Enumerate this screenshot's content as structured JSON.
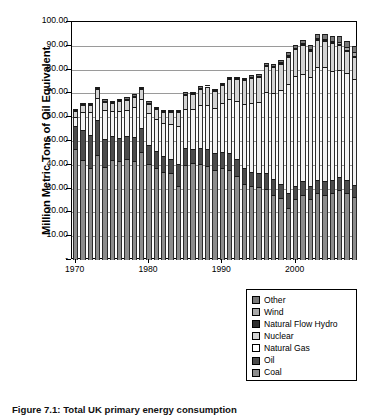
{
  "chart_data": {
    "type": "bar",
    "stacked": true,
    "title": "",
    "xlabel": "",
    "ylabel": "Million Metric Tons of Oil Equivalent",
    "ylim": [
      0,
      100
    ],
    "ytick_labels": [
      "100.00",
      "90.00",
      "80.00",
      "70.00",
      "60.00",
      "50.00",
      "40.00",
      "30.00",
      "20.00",
      "10.00",
      "-"
    ],
    "ytick_values": [
      100,
      90,
      80,
      70,
      60,
      50,
      40,
      30,
      20,
      10,
      0
    ],
    "xtick_labels": [
      "1970",
      "1980",
      "1990",
      "2000"
    ],
    "xtick_values": [
      1970,
      1980,
      1990,
      2000
    ],
    "grid": true,
    "legend_position": "below-right",
    "categories": [
      1970,
      1971,
      1972,
      1973,
      1974,
      1975,
      1976,
      1977,
      1978,
      1979,
      1980,
      1981,
      1982,
      1983,
      1984,
      1985,
      1986,
      1987,
      1988,
      1989,
      1990,
      1991,
      1992,
      1993,
      1994,
      1995,
      1996,
      1997,
      1998,
      1999,
      2000,
      2001,
      2002,
      2003,
      2004,
      2005,
      2006,
      2007,
      2008
    ],
    "series": [
      {
        "name": "Coal",
        "color": "#8c8c8c",
        "values": [
          46.5,
          42.0,
          38.6,
          44.2,
          39.0,
          42.0,
          41.8,
          42.4,
          41.6,
          45.3,
          40.2,
          38.8,
          37.0,
          36.5,
          31.0,
          40.0,
          40.8,
          40.5,
          39.5,
          38.0,
          38.5,
          38.0,
          35.5,
          32.0,
          31.0,
          30.5,
          30.0,
          27.5,
          26.0,
          22.0,
          25.5,
          27.5,
          25.5,
          28.0,
          27.5,
          28.0,
          29.5,
          28.0,
          26.5
        ],
        "unit": "Million Metric Tons of Oil Equivalent"
      },
      {
        "name": "Oil",
        "color": "#4c4c4c",
        "values": [
          10.0,
          12.5,
          14.0,
          14.5,
          12.0,
          10.0,
          9.5,
          9.5,
          10.0,
          10.0,
          8.0,
          7.0,
          6.5,
          6.0,
          9.5,
          7.0,
          6.0,
          6.5,
          7.0,
          7.0,
          7.0,
          7.0,
          7.0,
          6.5,
          6.0,
          6.0,
          6.5,
          6.5,
          6.0,
          6.0,
          5.5,
          5.5,
          5.5,
          5.5,
          5.5,
          5.5,
          5.5,
          5.5,
          5.0
        ],
        "unit": "Million Metric Tons of Oil Equivalent"
      },
      {
        "name": "Natural Gas",
        "color": "#f2f2f2",
        "values": [
          3.5,
          7.5,
          9.5,
          9.5,
          12.0,
          10.5,
          11.5,
          11.0,
          12.5,
          12.5,
          13.5,
          13.5,
          14.0,
          14.5,
          16.0,
          16.5,
          16.5,
          18.0,
          18.5,
          19.0,
          20.5,
          22.5,
          24.5,
          27.0,
          29.0,
          30.0,
          34.0,
          36.0,
          39.5,
          46.0,
          46.5,
          45.0,
          46.0,
          47.5,
          48.0,
          46.0,
          45.0,
          45.0,
          44.5
        ],
        "unit": "Million Metric Tons of Oil Equivalent"
      },
      {
        "name": "Nuclear",
        "color": "#d4d4d4",
        "values": [
          2.5,
          3.0,
          3.0,
          3.5,
          3.5,
          3.5,
          4.0,
          4.5,
          4.5,
          4.0,
          4.0,
          4.0,
          4.5,
          5.0,
          5.5,
          6.0,
          6.5,
          7.0,
          7.5,
          7.0,
          7.5,
          8.5,
          9.0,
          10.0,
          10.5,
          10.5,
          11.0,
          11.0,
          11.0,
          11.5,
          11.0,
          12.5,
          11.0,
          11.5,
          11.0,
          11.5,
          10.5,
          9.5,
          9.5
        ],
        "unit": "Million Metric Tons of Oil Equivalent"
      },
      {
        "name": "Natural Flow Hydro",
        "color": "#2e2e2e",
        "values": [
          0.4,
          0.4,
          0.4,
          0.4,
          0.4,
          0.4,
          0.4,
          0.4,
          0.4,
          0.4,
          0.4,
          0.4,
          0.4,
          0.4,
          0.4,
          0.4,
          0.4,
          0.4,
          0.4,
          0.4,
          0.4,
          0.4,
          0.4,
          0.4,
          0.4,
          0.4,
          0.4,
          0.4,
          0.4,
          0.4,
          0.4,
          0.4,
          0.4,
          0.4,
          0.4,
          0.4,
          0.4,
          0.4,
          0.4
        ],
        "unit": "Million Metric Tons of Oil Equivalent"
      },
      {
        "name": "Wind",
        "color": "#a8a8a8",
        "values": [
          0.0,
          0.0,
          0.0,
          0.0,
          0.0,
          0.0,
          0.0,
          0.0,
          0.0,
          0.0,
          0.0,
          0.0,
          0.0,
          0.0,
          0.0,
          0.0,
          0.0,
          0.0,
          0.0,
          0.0,
          0.0,
          0.0,
          0.0,
          0.0,
          0.1,
          0.1,
          0.1,
          0.1,
          0.1,
          0.2,
          0.2,
          0.2,
          0.3,
          0.3,
          0.4,
          0.6,
          0.8,
          1.0,
          1.3
        ],
        "unit": "Million Metric Tons of Oil Equivalent"
      },
      {
        "name": "Other",
        "color": "#7a7a7a",
        "values": [
          0.6,
          0.6,
          0.6,
          0.6,
          0.6,
          0.6,
          0.6,
          0.6,
          0.6,
          0.6,
          0.6,
          0.6,
          0.6,
          0.6,
          0.6,
          0.6,
          0.6,
          0.6,
          0.6,
          0.6,
          0.6,
          0.6,
          0.7,
          0.7,
          0.8,
          0.8,
          0.9,
          0.9,
          1.0,
          1.2,
          1.3,
          1.4,
          1.6,
          1.8,
          2.0,
          2.2,
          2.4,
          2.6,
          2.8
        ],
        "unit": "Million Metric Tons of Oil Equivalent"
      }
    ],
    "stack_order_bottom_to_top": [
      "Coal",
      "Oil",
      "Natural Gas",
      "Nuclear",
      "Natural Flow Hydro",
      "Wind",
      "Other"
    ],
    "legend_order_top_to_bottom": [
      "Other",
      "Wind",
      "Natural Flow Hydro",
      "Nuclear",
      "Natural Gas",
      "Oil",
      "Coal"
    ]
  },
  "legend": {
    "items": [
      {
        "label": "Other",
        "color": "#7a7a7a"
      },
      {
        "label": "Wind",
        "color": "#a8a8a8"
      },
      {
        "label": "Natural Flow Hydro",
        "color": "#2e2e2e"
      },
      {
        "label": "Nuclear",
        "color": "#d4d4d4"
      },
      {
        "label": "Natural Gas",
        "color": "#ffffff"
      },
      {
        "label": "Oil",
        "color": "#4c4c4c"
      },
      {
        "label": "Coal",
        "color": "#8c8c8c"
      }
    ]
  },
  "caption": {
    "text": "Figure 7.1: Total UK primary energy consumption"
  }
}
